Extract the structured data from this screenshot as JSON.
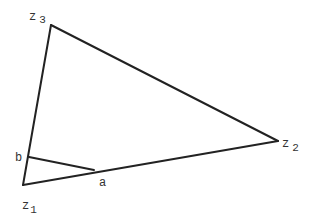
{
  "diagram": {
    "vertices": [
      {
        "id": "z1",
        "base": "z",
        "sub": "1",
        "x": 23,
        "y": 185
      },
      {
        "id": "z2",
        "base": "z",
        "sub": "2",
        "x": 278,
        "y": 141
      },
      {
        "id": "z3",
        "base": "z",
        "sub": "3",
        "x": 51,
        "y": 25
      }
    ],
    "points": [
      {
        "id": "b",
        "label": "b",
        "x": 29,
        "y": 157
      },
      {
        "id": "a",
        "label": "a",
        "x": 94,
        "y": 170
      }
    ],
    "edges": [
      [
        "z1",
        "z2"
      ],
      [
        "z2",
        "z3"
      ],
      [
        "z3",
        "z1"
      ],
      [
        "b",
        "a"
      ]
    ],
    "labels": {
      "z1": {
        "base": "z",
        "sub": "1"
      },
      "z2": {
        "base": "z",
        "sub": "2"
      },
      "z3": {
        "base": "z",
        "sub": "3"
      },
      "a": "a",
      "b": "b"
    },
    "line_color": "#222222"
  }
}
